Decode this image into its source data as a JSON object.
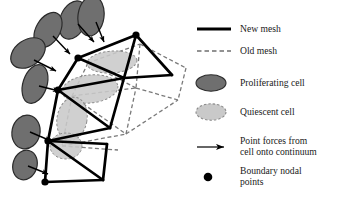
{
  "figure": {
    "background_color": "#ffffff"
  },
  "colors": {
    "new_mesh": "#000000",
    "old_mesh": "#7a7a7a",
    "proliferating_cell_fill": "#6f6f6f",
    "proliferating_cell_stroke": "#2b2b2b",
    "quiescent_cell_fill": "#c9c9c9",
    "quiescent_cell_stroke": "#8c8c8c",
    "node": "#000000",
    "arrow": "#000000",
    "text": "#1a1a1a"
  },
  "legend": {
    "items": [
      {
        "id": "new-mesh",
        "marker": "solid-line",
        "label": "New mesh",
        "label_line2": ""
      },
      {
        "id": "old-mesh",
        "marker": "dashed-line",
        "label": "Old mesh",
        "label_line2": ""
      },
      {
        "id": "proliferating-cell",
        "marker": "filled-ellipse",
        "label": "Proliferating cell",
        "label_line2": ""
      },
      {
        "id": "quiescent-cell",
        "marker": "light-dashed-ellipse",
        "label": "Quiescent cell",
        "label_line2": ""
      },
      {
        "id": "point-forces",
        "marker": "arrow",
        "label": "Point forces from",
        "label_line2": "cell onto continuum"
      },
      {
        "id": "boundary-nodal-points",
        "marker": "filled-dot",
        "label": "Boundary nodal",
        "label_line2": "points"
      }
    ]
  },
  "diagram": {
    "nodes": [
      {
        "id": "n-top-right",
        "x": 136,
        "y": 35
      },
      {
        "id": "n-upper-mid",
        "x": 78,
        "y": 58
      },
      {
        "id": "n-right",
        "x": 172,
        "y": 75
      },
      {
        "id": "n-mid-left",
        "x": 58,
        "y": 90
      },
      {
        "id": "n-centre",
        "x": 124,
        "y": 78
      },
      {
        "id": "n-lower-apex",
        "x": 110,
        "y": 128
      },
      {
        "id": "n-lower-left",
        "x": 48,
        "y": 141
      },
      {
        "id": "n-quad-right",
        "x": 107,
        "y": 144
      },
      {
        "id": "n-bottom-right",
        "x": 103,
        "y": 180
      },
      {
        "id": "n-bottom",
        "x": 45,
        "y": 182
      }
    ],
    "boundary_nodes": [
      "n-top-right",
      "n-upper-mid",
      "n-mid-left",
      "n-lower-left",
      "n-bottom"
    ],
    "new_mesh_edges": [
      [
        "n-upper-mid",
        "n-top-right"
      ],
      [
        "n-top-right",
        "n-right"
      ],
      [
        "n-right",
        "n-centre"
      ],
      [
        "n-centre",
        "n-upper-mid"
      ],
      [
        "n-top-right",
        "n-centre"
      ],
      [
        "n-upper-mid",
        "n-mid-left"
      ],
      [
        "n-mid-left",
        "n-centre"
      ],
      [
        "n-mid-left",
        "n-lower-apex"
      ],
      [
        "n-lower-apex",
        "n-centre"
      ],
      [
        "n-mid-left",
        "n-lower-left"
      ],
      [
        "n-lower-left",
        "n-lower-apex"
      ],
      [
        "n-lower-left",
        "n-quad-right"
      ],
      [
        "n-quad-right",
        "n-bottom-right"
      ],
      [
        "n-bottom-right",
        "n-bottom"
      ],
      [
        "n-bottom",
        "n-lower-left"
      ],
      [
        "n-lower-left",
        "n-bottom-right"
      ]
    ],
    "old_mesh_nodes": [
      {
        "id": "o-top-right",
        "x": 140,
        "y": 44
      },
      {
        "id": "o-upper-mid",
        "x": 88,
        "y": 63
      },
      {
        "id": "o-right",
        "x": 186,
        "y": 68
      },
      {
        "id": "o-mid-left",
        "x": 72,
        "y": 96
      },
      {
        "id": "o-centre",
        "x": 136,
        "y": 88
      },
      {
        "id": "o-far-right",
        "x": 178,
        "y": 100
      },
      {
        "id": "o-lower-apex",
        "x": 126,
        "y": 134
      },
      {
        "id": "o-lower-left",
        "x": 62,
        "y": 146
      },
      {
        "id": "o-quad-right",
        "x": 118,
        "y": 150
      }
    ],
    "old_mesh_edges": [
      [
        "o-upper-mid",
        "o-top-right"
      ],
      [
        "o-top-right",
        "o-right"
      ],
      [
        "o-right",
        "o-far-right"
      ],
      [
        "o-far-right",
        "o-centre"
      ],
      [
        "o-centre",
        "o-upper-mid"
      ],
      [
        "o-top-right",
        "o-centre"
      ],
      [
        "o-upper-mid",
        "o-mid-left"
      ],
      [
        "o-mid-left",
        "o-centre"
      ],
      [
        "o-mid-left",
        "o-lower-apex"
      ],
      [
        "o-lower-apex",
        "o-centre"
      ],
      [
        "o-mid-left",
        "o-lower-left"
      ],
      [
        "o-lower-left",
        "o-lower-apex"
      ],
      [
        "o-lower-left",
        "o-quad-right"
      ],
      [
        "o-lower-apex",
        "o-far-right"
      ]
    ],
    "proliferating_cells": [
      {
        "id": "p1",
        "cx": 73,
        "cy": 20,
        "rx": 13,
        "ry": 20,
        "rot": 22
      },
      {
        "id": "p2",
        "cx": 48,
        "cy": 30,
        "rx": 12,
        "ry": 19,
        "rot": 30
      },
      {
        "id": "p3",
        "cx": 91,
        "cy": 16,
        "rx": 13,
        "ry": 20,
        "rot": 8
      },
      {
        "id": "p4",
        "cx": 28,
        "cy": 53,
        "rx": 13,
        "ry": 19,
        "rot": 55
      },
      {
        "id": "p5",
        "cx": 35,
        "cy": 84,
        "rx": 12,
        "ry": 20,
        "rot": 18
      },
      {
        "id": "p6",
        "cx": 26,
        "cy": 132,
        "rx": 14,
        "ry": 17,
        "rot": 12
      },
      {
        "id": "p7",
        "cx": 25,
        "cy": 165,
        "rx": 12,
        "ry": 15,
        "rot": 18
      }
    ],
    "quiescent_cells": [
      {
        "id": "q1",
        "cx": 112,
        "cy": 62,
        "rx": 25,
        "ry": 11,
        "rot": -4
      },
      {
        "id": "q2",
        "cx": 90,
        "cy": 89,
        "rx": 28,
        "ry": 14,
        "rot": -6
      },
      {
        "id": "q3",
        "cx": 72,
        "cy": 119,
        "rx": 15,
        "ry": 22,
        "rot": 10
      },
      {
        "id": "q4",
        "cx": 66,
        "cy": 146,
        "rx": 16,
        "ry": 13,
        "rot": 0
      }
    ],
    "force_arrows": [
      {
        "id": "a1",
        "x1": 78,
        "y1": 24,
        "x2": 94,
        "y2": 42
      },
      {
        "id": "a2",
        "x1": 53,
        "y1": 36,
        "x2": 70,
        "y2": 54
      },
      {
        "id": "a3",
        "x1": 96,
        "y1": 22,
        "x2": 104,
        "y2": 42
      },
      {
        "id": "a4",
        "x1": 34,
        "y1": 60,
        "x2": 56,
        "y2": 71
      },
      {
        "id": "a5",
        "x1": 39,
        "y1": 86,
        "x2": 59,
        "y2": 91
      },
      {
        "id": "a6",
        "x1": 30,
        "y1": 132,
        "x2": 51,
        "y2": 141
      },
      {
        "id": "a7",
        "x1": 28,
        "y1": 166,
        "x2": 48,
        "y2": 174
      }
    ]
  }
}
